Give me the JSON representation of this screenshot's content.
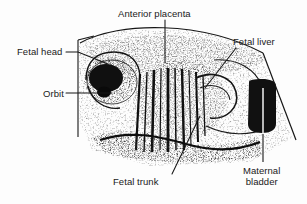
{
  "figure": {
    "kind": "labeled-ultrasound-illustration",
    "background_color": "#fdfdfd",
    "ink_color": "#111111",
    "labels": [
      {
        "id": "anterior-placenta",
        "text": "Anterior placenta",
        "lines": [
          "Anterior placenta"
        ],
        "x": 118,
        "y": 8,
        "align": "left",
        "leader": "M165,20 L165,63"
      },
      {
        "id": "fetal-head",
        "text": "Fetal head",
        "lines": [
          "Fetal head"
        ],
        "x": 17,
        "y": 46,
        "align": "left",
        "leader": "M66,52 L78,52 L108,64"
      },
      {
        "id": "orbit",
        "text": "Orbit",
        "lines": [
          "Orbit"
        ],
        "x": 43,
        "y": 88,
        "align": "left",
        "leader": "M66,93 L112,93"
      },
      {
        "id": "fetal-liver",
        "text": "Fetal liver",
        "lines": [
          "Fetal liver"
        ],
        "x": 233,
        "y": 36,
        "align": "left",
        "leader": "M236,48 L205,88"
      },
      {
        "id": "fetal-trunk",
        "text": "Fetal trunk",
        "lines": [
          "Fetal trunk"
        ],
        "x": 113,
        "y": 176,
        "align": "left",
        "leader": "M172,174 L200,116"
      },
      {
        "id": "maternal-bladder",
        "text": "Maternal bladder",
        "lines": [
          "Maternal",
          "bladder"
        ],
        "x": 243,
        "y": 165,
        "align": "left",
        "leader": "M263,162 L263,88"
      }
    ],
    "scan_sector": {
      "top_arc": "M80,42 C120,20 200,20 262,52",
      "left_edge": "M78,40 L78,136",
      "right_edge": "M262,52 L296,140"
    },
    "structures": [
      {
        "id": "fetal-head-mass",
        "label": "fetal head",
        "cx": 110,
        "cy": 78,
        "rx": 27,
        "ry": 24
      },
      {
        "id": "fetal-trunk-mass",
        "label": "fetal trunk",
        "cx": 178,
        "cy": 100,
        "rx": 42,
        "ry": 38
      },
      {
        "id": "placenta-mass",
        "label": "anterior placenta",
        "cx": 170,
        "cy": 55,
        "rx": 70,
        "ry": 20
      },
      {
        "id": "maternal-bladder-mass",
        "label": "maternal bladder",
        "x": 247,
        "y": 80,
        "w": 30,
        "h": 54,
        "fill": "#111111"
      }
    ]
  }
}
